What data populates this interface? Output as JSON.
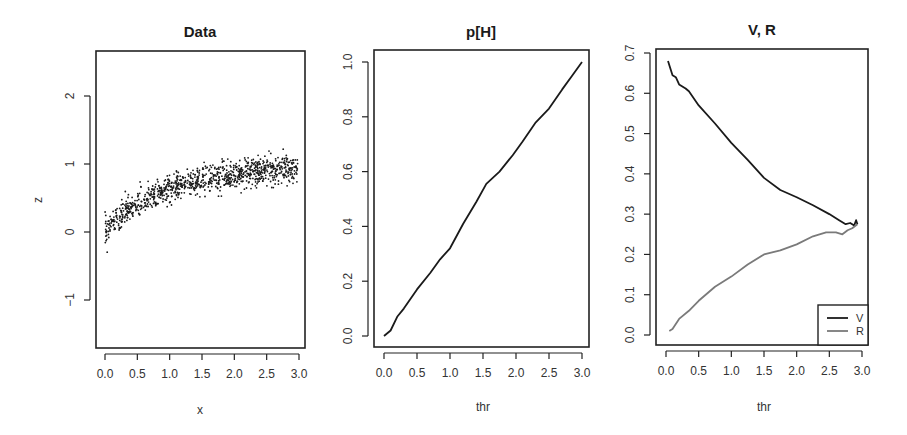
{
  "chart_data": [
    {
      "type": "scatter",
      "title": "Data",
      "xlabel": "x",
      "ylabel": "z",
      "xlim": [
        -0.15,
        3.1
      ],
      "ylim": [
        -1.7,
        2.66
      ],
      "xticks": [
        0.0,
        0.5,
        1.0,
        1.5,
        2.0,
        2.5,
        3.0
      ],
      "xtick_labels": [
        "0.0",
        "0.5",
        "1.0",
        "1.5",
        "2.0",
        "2.5",
        "3.0"
      ],
      "yticks": [
        -1,
        0,
        1,
        2
      ],
      "ytick_labels": [
        "−1",
        "0",
        "1",
        "2"
      ],
      "grid": false,
      "description": "~1000 points, x uniform on [0,3], z approx 1 - exp(-x) style saturating curve with noise sd ~0.1",
      "trend": {
        "x": [
          0.0,
          0.25,
          0.5,
          0.75,
          1.0,
          1.25,
          1.5,
          1.75,
          2.0,
          2.25,
          2.5,
          2.75,
          3.0
        ],
        "z": [
          0.02,
          0.25,
          0.4,
          0.52,
          0.63,
          0.7,
          0.77,
          0.81,
          0.85,
          0.88,
          0.91,
          0.93,
          0.95
        ]
      },
      "n_points": 1000,
      "noise_sd": 0.1
    },
    {
      "type": "line",
      "title": "p[H]",
      "xlabel": "thr",
      "ylabel": "",
      "xlim": [
        -0.1,
        3.05
      ],
      "ylim": [
        -0.04,
        1.05
      ],
      "xticks": [
        0.0,
        0.5,
        1.0,
        1.5,
        2.0,
        2.5,
        3.0
      ],
      "xtick_labels": [
        "0.0",
        "0.5",
        "1.0",
        "1.5",
        "2.0",
        "2.5",
        "3.0"
      ],
      "yticks": [
        0.0,
        0.2,
        0.4,
        0.6,
        0.8,
        1.0
      ],
      "ytick_labels": [
        "0.0",
        "0.2",
        "0.4",
        "0.6",
        "0.8",
        "1.0"
      ],
      "grid": false,
      "series": [
        {
          "name": "p[H]",
          "color": "#1a1a1a",
          "x": [
            0.0,
            0.1,
            0.2,
            0.3,
            0.5,
            0.7,
            0.85,
            1.0,
            1.2,
            1.4,
            1.55,
            1.75,
            1.95,
            2.1,
            2.3,
            2.5,
            2.7,
            2.85,
            3.0
          ],
          "y": [
            0.0,
            0.02,
            0.07,
            0.1,
            0.17,
            0.23,
            0.28,
            0.32,
            0.41,
            0.49,
            0.555,
            0.6,
            0.66,
            0.71,
            0.78,
            0.83,
            0.9,
            0.95,
            1.0
          ]
        }
      ]
    },
    {
      "type": "line",
      "title": "V, R",
      "xlabel": "thr",
      "ylabel": "",
      "xlim": [
        -0.1,
        3.05
      ],
      "ylim": [
        -0.025,
        0.71
      ],
      "xticks": [
        0.0,
        0.5,
        1.0,
        1.5,
        2.0,
        2.5,
        3.0
      ],
      "xtick_labels": [
        "0.0",
        "0.5",
        "1.0",
        "1.5",
        "2.0",
        "2.5",
        "3.0"
      ],
      "yticks": [
        0.0,
        0.1,
        0.2,
        0.3,
        0.4,
        0.5,
        0.6,
        0.7
      ],
      "ytick_labels": [
        "0.0",
        "0.1",
        "0.2",
        "0.3",
        "0.4",
        "0.5",
        "0.6",
        "0.7"
      ],
      "grid": false,
      "legend": {
        "position": "bottomright",
        "entries": [
          "V",
          "R"
        ]
      },
      "series": [
        {
          "name": "V",
          "color": "#1a1a1a",
          "x": [
            0.03,
            0.1,
            0.15,
            0.2,
            0.3,
            0.35,
            0.5,
            0.75,
            1.0,
            1.25,
            1.5,
            1.75,
            2.0,
            2.25,
            2.5,
            2.65,
            2.75,
            2.82,
            2.88,
            2.91,
            2.93
          ],
          "y": [
            0.68,
            0.645,
            0.64,
            0.622,
            0.612,
            0.605,
            0.57,
            0.525,
            0.477,
            0.435,
            0.39,
            0.36,
            0.342,
            0.322,
            0.3,
            0.285,
            0.275,
            0.278,
            0.272,
            0.285,
            0.275
          ]
        },
        {
          "name": "R",
          "color": "#7a7a7a",
          "x": [
            0.05,
            0.1,
            0.2,
            0.35,
            0.5,
            0.75,
            1.0,
            1.25,
            1.5,
            1.75,
            2.0,
            2.25,
            2.45,
            2.6,
            2.7,
            2.78,
            2.85,
            2.93
          ],
          "y": [
            0.01,
            0.015,
            0.04,
            0.06,
            0.085,
            0.12,
            0.145,
            0.175,
            0.2,
            0.21,
            0.225,
            0.245,
            0.255,
            0.255,
            0.25,
            0.26,
            0.265,
            0.275
          ]
        }
      ]
    }
  ],
  "panels": [
    {
      "title": "Data",
      "xlabel": "x",
      "ylabel": "z"
    },
    {
      "title": "p[H]",
      "xlabel": "thr",
      "ylabel": ""
    },
    {
      "title": "V, R",
      "xlabel": "thr",
      "ylabel": ""
    }
  ],
  "legend": {
    "entries": [
      "V",
      "R"
    ]
  }
}
